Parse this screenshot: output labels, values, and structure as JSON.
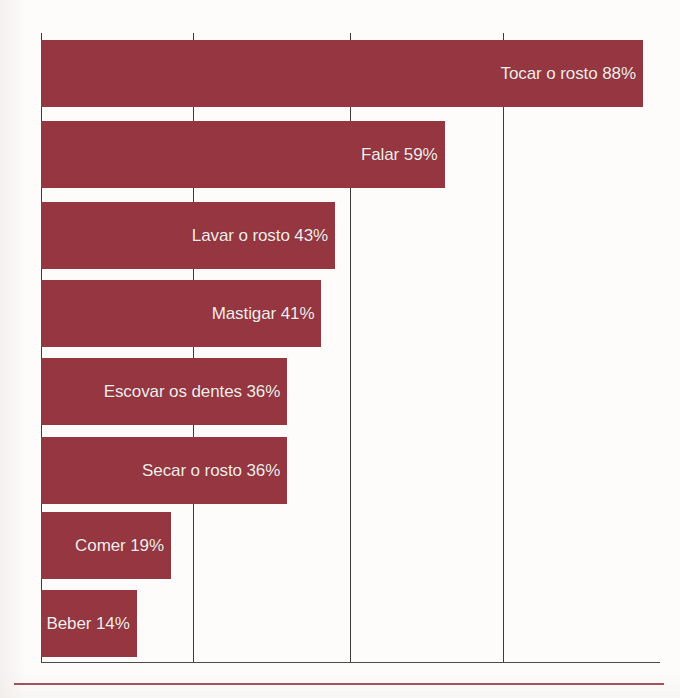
{
  "chart_data": {
    "type": "bar",
    "orientation": "horizontal",
    "title": "",
    "subtitle": "",
    "xlabel": "",
    "ylabel": "",
    "categories": [
      "Tocar o rosto",
      "Falar",
      "Lavar o rosto",
      "Mastigar",
      "Escovar os dentes",
      "Secar o rosto",
      "Comer",
      "Beber"
    ],
    "values": [
      88,
      59,
      43,
      41,
      36,
      36,
      19,
      14
    ],
    "unit": "%",
    "data_labels": [
      "Tocar o rosto 88%",
      "Falar 59%",
      "Lavar o rosto 43%",
      "Mastigar 41%",
      "Escovar os dentes 36%",
      "Secar o rosto 36%",
      "Comer 19%",
      "Beber 14%"
    ],
    "xlim": [
      0,
      90
    ],
    "tick_values": [
      0,
      22.5,
      45,
      67.5
    ],
    "tick_labels": [
      "",
      "",
      "",
      ""
    ],
    "grid": true,
    "grid_axis": "x",
    "legend": false,
    "legend_position": "none",
    "bar_color": "#953640",
    "label_color": "#f4eeec",
    "axis_color": "#3b3b3b",
    "background_color": "#fdfcfb",
    "rule_color": "#a2525c"
  }
}
